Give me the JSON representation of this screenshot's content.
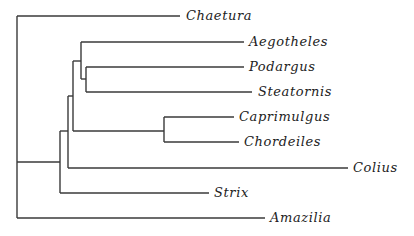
{
  "diagram": {
    "type": "phylogenetic-tree",
    "line_color": "#3a3a3a",
    "text_color": "#222222",
    "taxa": [
      {
        "name": "Chaetura",
        "y": 16,
        "tip_x": 180,
        "label_x": 186
      },
      {
        "name": "Aegotheles",
        "y": 42,
        "tip_x": 244,
        "label_x": 249
      },
      {
        "name": "Podargus",
        "y": 67,
        "tip_x": 244,
        "label_x": 249
      },
      {
        "name": "Steatornis",
        "y": 92,
        "tip_x": 252,
        "label_x": 258
      },
      {
        "name": "Caprimulgus",
        "y": 117,
        "tip_x": 234,
        "label_x": 239
      },
      {
        "name": "Chordeiles",
        "y": 142,
        "tip_x": 239,
        "label_x": 244
      },
      {
        "name": "Colius",
        "y": 168,
        "tip_x": 348,
        "label_x": 353
      },
      {
        "name": "Strix",
        "y": 193,
        "tip_x": 209,
        "label_x": 214
      },
      {
        "name": "Amazilia",
        "y": 218,
        "tip_x": 265,
        "label_x": 270
      }
    ],
    "newick": "((((((Aegotheles,(Podargus,Steatornis)),(Caprimulgus,Chordeiles)),Colius),Strix),Chaetura),Amazilia)"
  }
}
